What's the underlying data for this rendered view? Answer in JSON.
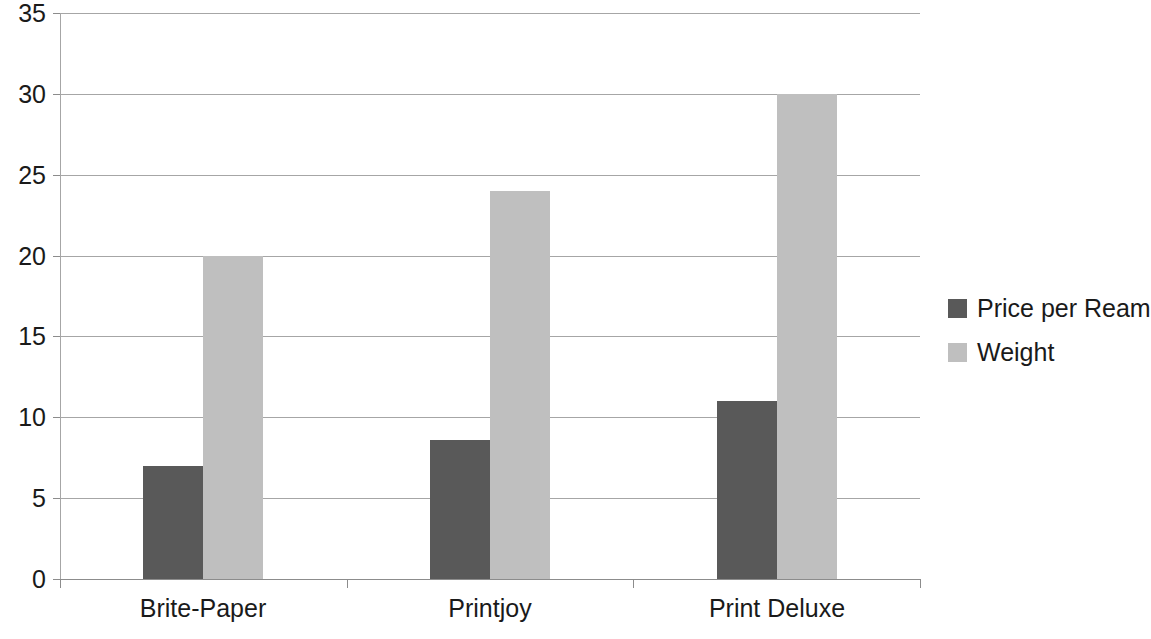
{
  "chart_data": {
    "type": "bar",
    "title": "",
    "subtitle": "",
    "xlabel": "",
    "ylabel": "",
    "categories": [
      "Brite-Paper",
      "Printjoy",
      "Print Deluxe"
    ],
    "series": [
      {
        "name": "Price per Ream",
        "color": "#595959",
        "values": [
          7,
          8.6,
          11
        ]
      },
      {
        "name": "Weight",
        "color": "#bfbfbf",
        "values": [
          20,
          24,
          30
        ]
      }
    ],
    "ylim": [
      0,
      35
    ],
    "y_ticks": [
      0,
      5,
      10,
      15,
      20,
      25,
      30,
      35
    ],
    "y_tick_labels": [
      "0",
      "5",
      "10",
      "15",
      "20",
      "25",
      "30",
      "35"
    ],
    "grid": true,
    "grid_axis": "y",
    "legend_position": "right",
    "legend": [
      "Price per Ream",
      "Weight"
    ],
    "background_color": "#ffffff",
    "gridline_color": "#a6a6a6",
    "axis_color": "#8c8c8c",
    "text_color": "#1a1a1a"
  }
}
